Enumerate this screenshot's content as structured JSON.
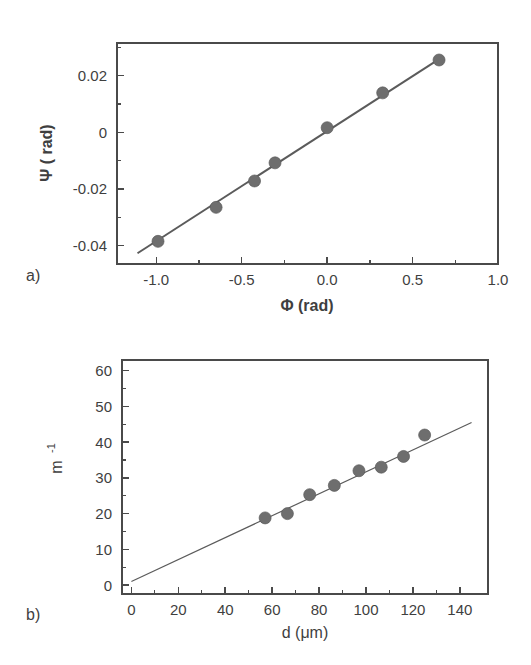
{
  "figure": {
    "panel_a_label": "a)",
    "panel_b_label": "b)"
  },
  "chart_data": [
    {
      "id": "panel-a",
      "type": "scatter",
      "title": "",
      "panel_label": "a)",
      "xlabel": "Φ (rad)",
      "ylabel": "Ψ ( rad)",
      "xlim": [
        -1.23,
        1.0
      ],
      "ylim": [
        -0.0465,
        0.0315
      ],
      "xticks": [
        -1.0,
        -0.5,
        0.0,
        0.5,
        1.0
      ],
      "xticklabels": [
        "-1.0",
        "-0.5",
        "0.0",
        "0.5",
        "1.0"
      ],
      "xminorticks": [
        -0.75,
        -0.25,
        0.25,
        0.75
      ],
      "yticks": [
        0.02,
        0,
        -0.02,
        -0.04
      ],
      "yticklabels": [
        "0.02",
        "0",
        "-0.02",
        "-0.04"
      ],
      "yminorticks": [
        0.03,
        0.01,
        -0.01,
        -0.03
      ],
      "grid": false,
      "legend": "none",
      "points": [
        {
          "x": -0.99,
          "y": -0.0385
        },
        {
          "x": -0.65,
          "y": -0.0265
        },
        {
          "x": -0.425,
          "y": -0.0172
        },
        {
          "x": -0.305,
          "y": -0.0108
        },
        {
          "x": 0.0,
          "y": 0.0016
        },
        {
          "x": 0.325,
          "y": 0.0139
        },
        {
          "x": 0.655,
          "y": 0.0255
        }
      ],
      "fit_line": {
        "x_start": -1.11,
        "y_start": -0.0427,
        "x_end": 0.68,
        "y_end": 0.0268
      }
    },
    {
      "id": "panel-b",
      "type": "scatter",
      "title": "",
      "panel_label": "b)",
      "xlabel": "d (μm)",
      "ylabel": "m⁻¹",
      "ylabel_base": "m",
      "ylabel_exponent": "-1",
      "xlim": [
        -4,
        152
      ],
      "ylim": [
        -2.5,
        63
      ],
      "xticks": [
        0,
        20,
        40,
        60,
        80,
        100,
        120,
        140
      ],
      "xticklabels": [
        "0",
        "20",
        "40",
        "60",
        "80",
        "100",
        "120",
        "140"
      ],
      "xminorticks": [
        10,
        30,
        50,
        70,
        90,
        110,
        130
      ],
      "yticks": [
        0,
        10,
        20,
        30,
        40,
        50,
        60
      ],
      "yticklabels": [
        "0",
        "10",
        "20",
        "30",
        "40",
        "50",
        "60"
      ],
      "yminorticks": [
        5,
        15,
        25,
        35,
        45,
        55
      ],
      "grid": false,
      "legend": "none",
      "points": [
        {
          "x": 57,
          "y": 18.8
        },
        {
          "x": 66.5,
          "y": 20.0
        },
        {
          "x": 76,
          "y": 25.3
        },
        {
          "x": 86.5,
          "y": 27.9
        },
        {
          "x": 97,
          "y": 32.0
        },
        {
          "x": 106.5,
          "y": 33.0
        },
        {
          "x": 116,
          "y": 36.0
        },
        {
          "x": 125,
          "y": 42.0
        }
      ],
      "fit_line": {
        "x_start": 0,
        "y_start": 1.0,
        "x_end": 145,
        "y_end": 45.5
      }
    }
  ],
  "colors": {
    "marker": "#6e6e6e",
    "line": "#5b5b5b",
    "axis": "#4a4a4a",
    "text": "#3f3f3f",
    "background": "#ffffff"
  }
}
